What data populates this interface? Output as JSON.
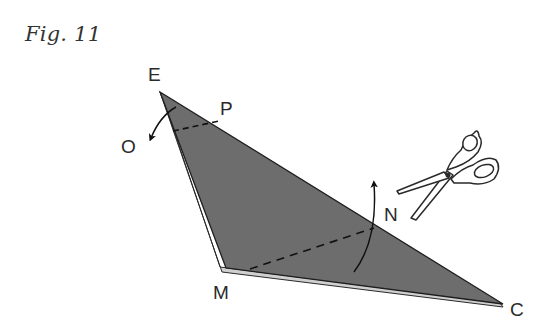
{
  "figure": {
    "title": "Fig. 11",
    "labels": {
      "E": "E",
      "P": "P",
      "O": "O",
      "N": "N",
      "M": "M",
      "C": "C"
    },
    "icons": [
      "scissors-icon",
      "fold-arrow-icon"
    ],
    "colors": {
      "paper_fill": "#6e6e6e",
      "paper_underside": "#c9c9c9",
      "outline": "#1e1e1e",
      "label": "#2a2a2a"
    }
  }
}
